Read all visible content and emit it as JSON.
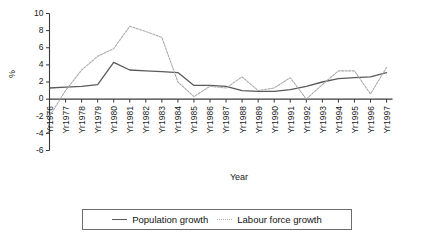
{
  "chart_data": {
    "type": "line",
    "title": "",
    "xlabel": "Year",
    "ylabel": "%",
    "ylim": [
      -6,
      10
    ],
    "yticks": [
      10,
      8,
      6,
      4,
      2,
      0,
      -2,
      -4,
      -6
    ],
    "grid": false,
    "legend_position": "bottom",
    "categories": [
      "Yr1976",
      "Yr1977",
      "Yr1978",
      "Yr1979",
      "Yr1980",
      "Yr1981",
      "Yr1982",
      "Yr1983",
      "Yr1984",
      "Yr1985",
      "Yr1986",
      "Yr1987",
      "Yr1988",
      "Yr1989",
      "Yr1990",
      "Yr1991",
      "Yr1992",
      "Yr1993",
      "Yr1994",
      "Yr1995",
      "Yr1996",
      "Yr1997"
    ],
    "series": [
      {
        "name": "Population growth",
        "style": "solid",
        "color": "#5a5a5a",
        "values": [
          1.3,
          1.4,
          1.5,
          1.7,
          4.3,
          3.4,
          3.3,
          3.2,
          3.1,
          1.6,
          1.6,
          1.5,
          1.0,
          0.9,
          0.9,
          1.1,
          1.5,
          2.0,
          2.4,
          2.5,
          2.6,
          3.1
        ]
      },
      {
        "name": "Labour force  growth",
        "style": "dotted",
        "color": "#a8a8a8",
        "values": [
          -2.0,
          1.0,
          3.4,
          5.0,
          5.9,
          8.5,
          7.9,
          7.2,
          2.0,
          0.3,
          1.5,
          1.3,
          2.6,
          1.0,
          1.3,
          2.5,
          0.0,
          1.7,
          3.3,
          3.3,
          0.6,
          3.7
        ]
      }
    ]
  },
  "legend": {
    "entries": [
      {
        "label": "Population growth",
        "style": "solid"
      },
      {
        "label": "Labour force  growth",
        "style": "dotted"
      }
    ]
  }
}
